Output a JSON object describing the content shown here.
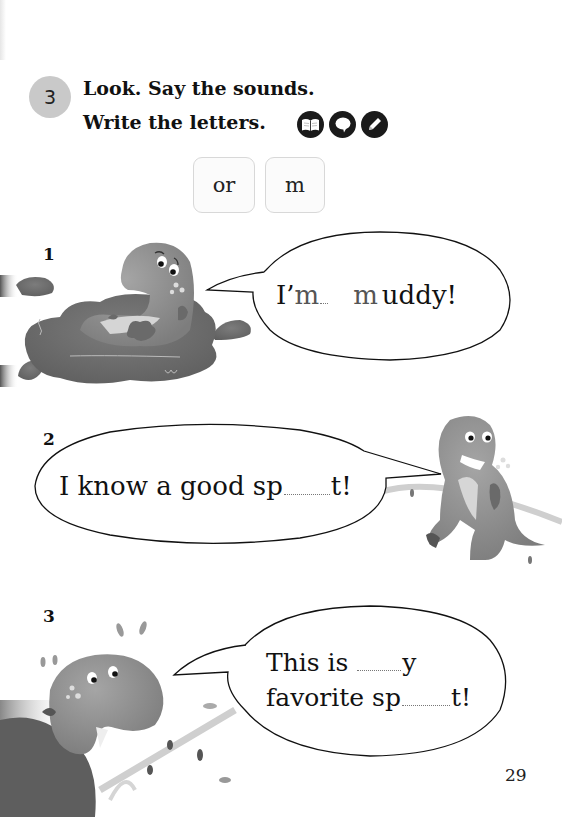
{
  "page": {
    "number": "29"
  },
  "exercise": {
    "number": "3",
    "instruction_line1": "Look. Say the sounds.",
    "instruction_line2": "Write the letters.",
    "activity_icons": [
      "book-icon",
      "speech-bubble-icon",
      "pencil-icon"
    ]
  },
  "letter_options": [
    "or",
    "m"
  ],
  "items": [
    {
      "number": "1",
      "illustration": "dinosaur sitting in mud puddle",
      "sentence_parts": [
        "I’",
        "m",
        " ",
        "m",
        "uddy!"
      ],
      "display": "I’m ___ m uddy!"
    },
    {
      "number": "2",
      "illustration": "dinosaur holding a vine",
      "sentence_parts": [
        "I know a good sp",
        "",
        "t!"
      ],
      "display": "I know a good sp___t!"
    },
    {
      "number": "3",
      "illustration": "dinosaur on a bush with leaves",
      "line1_parts": [
        "This is ",
        "",
        "y"
      ],
      "line2_parts": [
        "favorite sp",
        "",
        "t!"
      ],
      "display": "This is ___y favorite sp___t!"
    }
  ],
  "colors": {
    "badge": "#c9c9c9",
    "icon_bg": "#1a1a1a",
    "chip_border": "#d8d8d8",
    "dino": "#8a8a8a",
    "mud": "#6f6f6f"
  }
}
